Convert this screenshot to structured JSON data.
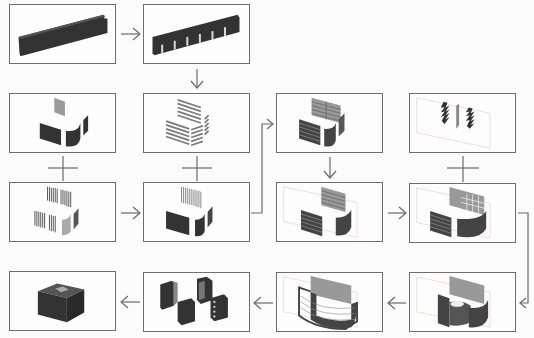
{
  "diagram": {
    "type": "process-flow",
    "colors": {
      "solid": "#333333",
      "panel_light": "#9a9a9a",
      "frame": "#6e6e6e",
      "guide_lines": "#d0b0b0"
    },
    "steps": [
      {
        "id": "s1",
        "label": "Solid beam"
      },
      {
        "id": "s2",
        "label": "Beam with slotted tabs"
      },
      {
        "id": "s3",
        "label": "Slatted panel sets"
      },
      {
        "id": "s4",
        "label": "Curved wall panels with top plate"
      },
      {
        "id": "s5",
        "label": "Vertical rib sets"
      },
      {
        "id": "s6",
        "label": "Ribs with curved wall panels"
      },
      {
        "id": "s7",
        "label": "Slatted panels combined"
      },
      {
        "id": "s8",
        "label": "Joint / connector pieces"
      },
      {
        "id": "s9",
        "label": "Panels in construction grid"
      },
      {
        "id": "s10",
        "label": "Grid with connectors added"
      },
      {
        "id": "s11",
        "label": "Curved shell assembled"
      },
      {
        "id": "s12",
        "label": "Full shell assembly"
      },
      {
        "id": "s13",
        "label": "Modular blocks"
      },
      {
        "id": "s14",
        "label": "Final assembled unit"
      }
    ],
    "connections": [
      {
        "from": "s1",
        "to": "s2",
        "type": "arrow"
      },
      {
        "from": "s2",
        "to": "s3",
        "type": "arrow"
      },
      {
        "from": "s3",
        "to": "s6",
        "type": "plus"
      },
      {
        "from": "s4",
        "to": "s5",
        "type": "plus"
      },
      {
        "from": "s5",
        "to": "s6",
        "type": "arrow"
      },
      {
        "from": "s6",
        "to": "s7",
        "type": "arrow"
      },
      {
        "from": "s7",
        "to": "s9",
        "type": "arrow"
      },
      {
        "from": "s9",
        "to": "s10",
        "type": "arrow"
      },
      {
        "from": "s8",
        "to": "s10",
        "type": "plus"
      },
      {
        "from": "s10",
        "to": "s11",
        "type": "arrow"
      },
      {
        "from": "s11",
        "to": "s12",
        "type": "arrow"
      },
      {
        "from": "s12",
        "to": "s13",
        "type": "arrow"
      },
      {
        "from": "s13",
        "to": "s14",
        "type": "arrow"
      }
    ]
  }
}
